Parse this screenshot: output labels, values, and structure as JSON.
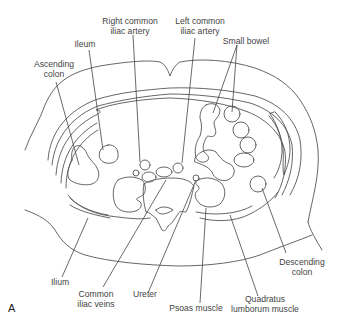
{
  "figure": {
    "panel_label": "A",
    "type": "cross-sectional anatomical line drawing (abdomen/pelvis)",
    "line_color": "#555555",
    "text_color": "#444444",
    "background": "#ffffff"
  },
  "labels": {
    "right_common_iliac_artery": {
      "line1": "Right common",
      "line2": "iliac artery"
    },
    "left_common_iliac_artery": {
      "line1": "Left common",
      "line2": "iliac artery"
    },
    "ileum": {
      "line1": "Ileum"
    },
    "ascending_colon": {
      "line1": "Ascending",
      "line2": "colon"
    },
    "small_bowel": {
      "line1": "Small bowel"
    },
    "ilium": {
      "line1": "Ilium"
    },
    "common_iliac_veins": {
      "line1": "Common",
      "line2": "iliac veins"
    },
    "ureter": {
      "line1": "Ureter"
    },
    "psoas_muscle": {
      "line1": "Psoas muscle"
    },
    "quadratus_lumborum_muscle": {
      "line1": "Quadratus",
      "line2": "lumborum muscle"
    },
    "descending_colon": {
      "line1": "Descending",
      "line2": "colon"
    }
  }
}
